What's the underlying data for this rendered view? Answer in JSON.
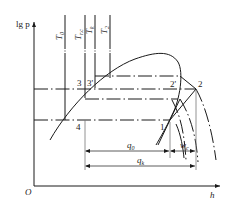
{
  "diagram": {
    "type": "lg p - h refrigeration cycle diagram",
    "axes": {
      "y_label": "lg p",
      "x_label": "h",
      "origin_label": "O"
    },
    "isotherm_labels": [
      {
        "main": "T",
        "sub": "0"
      },
      {
        "main": "T",
        "sub": "r.c"
      },
      {
        "main": "T",
        "sub": "k"
      },
      {
        "main": "T",
        "sub": "2"
      }
    ],
    "point_labels": [
      "3",
      "3'",
      "4",
      "1",
      "2'",
      "2"
    ],
    "dimension_labels": {
      "q0": {
        "main": "q",
        "sub": "0"
      },
      "qk": {
        "main": "q",
        "sub": "k"
      },
      "wc": {
        "main": "w",
        "sub": "c"
      }
    },
    "colors": {
      "line": "#1a1a1a",
      "background": "#ffffff"
    }
  }
}
